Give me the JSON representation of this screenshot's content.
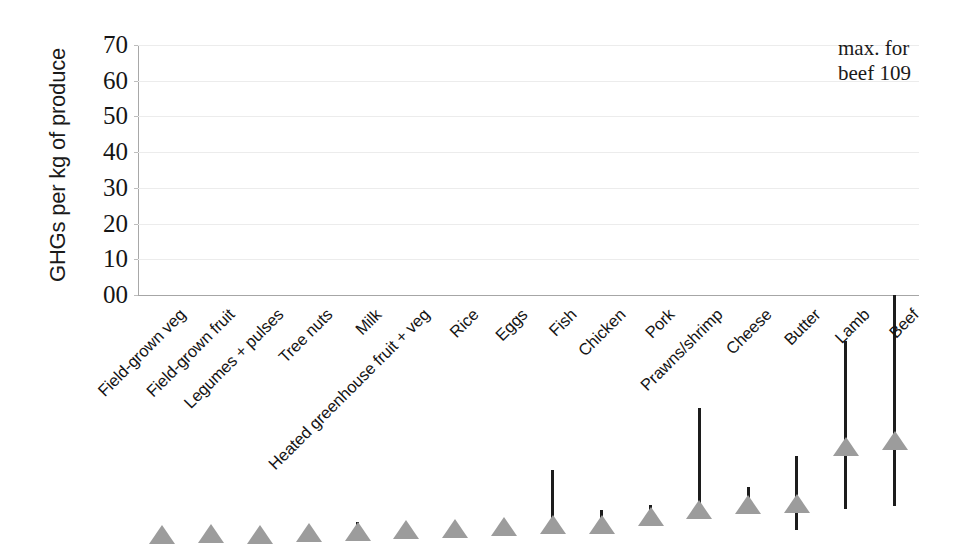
{
  "chart_data": {
    "type": "bar",
    "title": "",
    "xlabel": "",
    "ylabel": "GHGs per kg of produce",
    "ylim": [
      0,
      70
    ],
    "yticks": [
      "00",
      "10",
      "20",
      "30",
      "40",
      "50",
      "60",
      "70"
    ],
    "grid": true,
    "legend": false,
    "marker_shape": "triangle",
    "marker_color": "#9c9c9c",
    "errorbar_color": "#1c1c1c",
    "categories": [
      "Field-grown veg",
      "Field-grown fruit",
      "Legumes + pulses",
      "Tree nuts",
      "Milk",
      "Heated greenhouse fruit + veg",
      "Rice",
      "Eggs",
      "Fish",
      "Chicken",
      "Pork",
      "Prawns/shrimp",
      "Cheese",
      "Butter",
      "Lamb",
      "Beef"
    ],
    "values": [
      0.4,
      0.5,
      0.3,
      0.9,
      1.0,
      1.6,
      1.9,
      2.6,
      3.2,
      3.0,
      5.3,
      7.3,
      8.6,
      9.1,
      25.0,
      26.5
    ],
    "err_low": [
      0.4,
      0.5,
      0.3,
      0.9,
      1.0,
      1.6,
      1.9,
      2.6,
      3.2,
      3.0,
      5.3,
      7.3,
      8.6,
      4.3,
      10.2,
      11.0
    ],
    "err_high": [
      0.4,
      0.5,
      0.3,
      0.9,
      6.5,
      6.3,
      1.9,
      2.6,
      21.0,
      9.9,
      11.3,
      38.5,
      16.2,
      24.9,
      57.0,
      70.0
    ],
    "series": [
      {
        "name": "GHGs per kg of produce",
        "values": [
          0.4,
          0.5,
          0.3,
          0.9,
          1.0,
          1.6,
          1.9,
          2.6,
          3.2,
          3.0,
          5.3,
          7.3,
          8.6,
          9.1,
          25.0,
          26.5
        ]
      }
    ],
    "annotations": [
      {
        "text": "max. for\nbeef 109",
        "attached_to": "Beef"
      }
    ]
  },
  "annotation": {
    "max_beef": "max. for\nbeef 109"
  }
}
